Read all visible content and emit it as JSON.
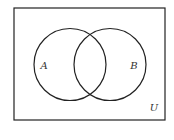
{
  "diagram": {
    "type": "venn",
    "universe_label": "U",
    "sets": [
      {
        "label": "A"
      },
      {
        "label": "B"
      }
    ],
    "stroke_color": "#222222",
    "background": "#ffffff"
  }
}
